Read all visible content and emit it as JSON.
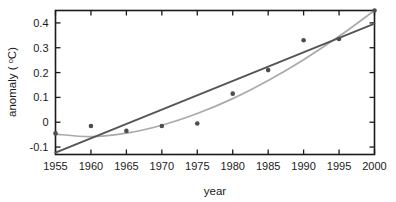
{
  "chart_data": {
    "type": "scatter",
    "title": "",
    "xlabel": "year",
    "ylabel": "anomaly ( °C)",
    "ylabel_text": "anomaly (",
    "ylabel_sup": "o",
    "ylabel_tail": "C)",
    "xlim": [
      1955,
      2000
    ],
    "ylim": [
      -0.13,
      0.45
    ],
    "grid": false,
    "legend": "none",
    "xticks": [
      1955,
      1960,
      1965,
      1970,
      1975,
      1980,
      1985,
      1990,
      1995,
      2000
    ],
    "xticklabels": [
      "1955",
      "1960",
      "1965",
      "1970",
      "1975",
      "1980",
      "1985",
      "1990",
      "1995",
      "2000"
    ],
    "yticks": [
      -0.1,
      0,
      0.1,
      0.2,
      0.3,
      0.4
    ],
    "yticklabels": [
      "-0.1",
      "0",
      "0.1",
      "0.2",
      "0.3",
      "0.4"
    ],
    "x": [
      1955,
      1960,
      1965,
      1970,
      1975,
      1980,
      1985,
      1990,
      1995,
      2000
    ],
    "values": [
      -0.045,
      -0.015,
      -0.035,
      -0.015,
      -0.005,
      0.115,
      0.21,
      0.33,
      0.335,
      0.45
    ],
    "series": [
      {
        "name": "anomaly observations",
        "type": "scatter",
        "marker": "circle",
        "color": "#4d4d4d",
        "x": [
          1955,
          1960,
          1965,
          1970,
          1975,
          1980,
          1985,
          1990,
          1995,
          2000
        ],
        "values": [
          -0.045,
          -0.015,
          -0.035,
          -0.015,
          -0.005,
          0.115,
          0.21,
          0.33,
          0.335,
          0.45
        ]
      },
      {
        "name": "linear fit",
        "type": "line",
        "color": "#555555",
        "x": [
          1955,
          2000
        ],
        "values": [
          -0.122,
          0.397
        ]
      },
      {
        "name": "curved fit",
        "type": "line",
        "color": "#aaaaaa",
        "x": [
          1955,
          1960,
          1965,
          1970,
          1975,
          1980,
          1985,
          1990,
          1995,
          2000
        ],
        "values": [
          -0.048,
          -0.058,
          -0.044,
          -0.012,
          0.035,
          0.095,
          0.168,
          0.252,
          0.346,
          0.45
        ]
      }
    ]
  },
  "axes": {
    "x_title": "year",
    "y_title_lead": "anomaly ( ",
    "y_title_sup": "o",
    "y_title_tail": "C)"
  },
  "ticks": {
    "x": [
      "1955",
      "1960",
      "1965",
      "1970",
      "1975",
      "1980",
      "1985",
      "1990",
      "1995",
      "2000"
    ],
    "y": [
      "0.4",
      "0.3",
      "0.2",
      "0.1",
      "0",
      "-0.1"
    ]
  },
  "colors": {
    "axis": "#1a1a1a",
    "linear_fit": "#555555",
    "curve_fit": "#aaaaaa",
    "marker": "#4d4d4d",
    "background": "#ffffff"
  }
}
